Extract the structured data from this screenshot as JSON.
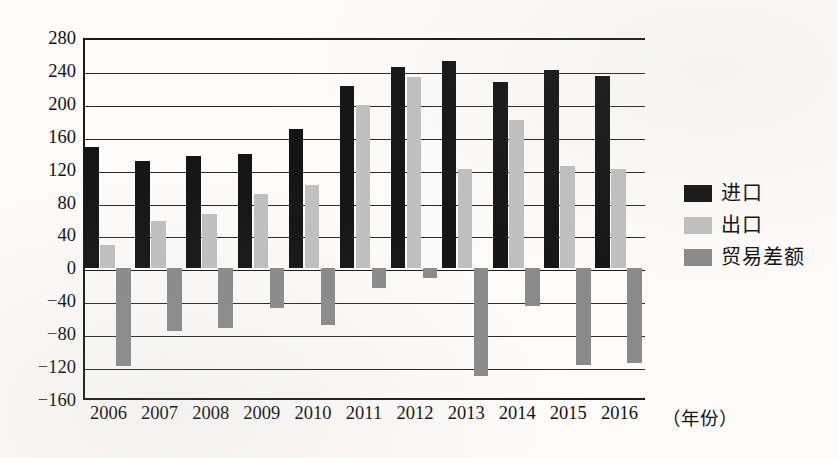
{
  "chart_data": {
    "type": "bar",
    "title": "",
    "xlabel": "（年份）",
    "ylabel": "",
    "categories": [
      "2006",
      "2007",
      "2008",
      "2009",
      "2010",
      "2011",
      "2012",
      "2013",
      "2014",
      "2015",
      "2016"
    ],
    "ylim": [
      -160,
      280
    ],
    "ytick_labels": [
      "280",
      "240",
      "200",
      "160",
      "120",
      "80",
      "40",
      "0",
      "−40",
      "−80",
      "−120",
      "−160"
    ],
    "ytick_values": [
      280,
      240,
      200,
      160,
      120,
      80,
      40,
      0,
      -40,
      -80,
      -120,
      -160
    ],
    "grid": true,
    "legend_position": "right",
    "series": [
      {
        "name": "进口",
        "color": "#141414",
        "values": [
          148,
          131,
          137,
          139,
          170,
          222,
          245,
          252,
          226,
          241,
          234
        ]
      },
      {
        "name": "出口",
        "color": "#c0c0c0",
        "values": [
          29,
          57,
          66,
          90,
          101,
          198,
          233,
          121,
          180,
          125,
          121
        ]
      },
      {
        "name": "贸易差额",
        "color": "#8a8a8a",
        "values": [
          -119,
          -76,
          -73,
          -48,
          -69,
          -24,
          -12,
          -131,
          -46,
          -118,
          -115
        ]
      }
    ]
  },
  "legend": {
    "items": [
      {
        "label": "进口",
        "swatch": "import-swatch"
      },
      {
        "label": "出口",
        "swatch": "export-swatch"
      },
      {
        "label": "贸易差额",
        "swatch": "balance-swatch"
      }
    ]
  }
}
